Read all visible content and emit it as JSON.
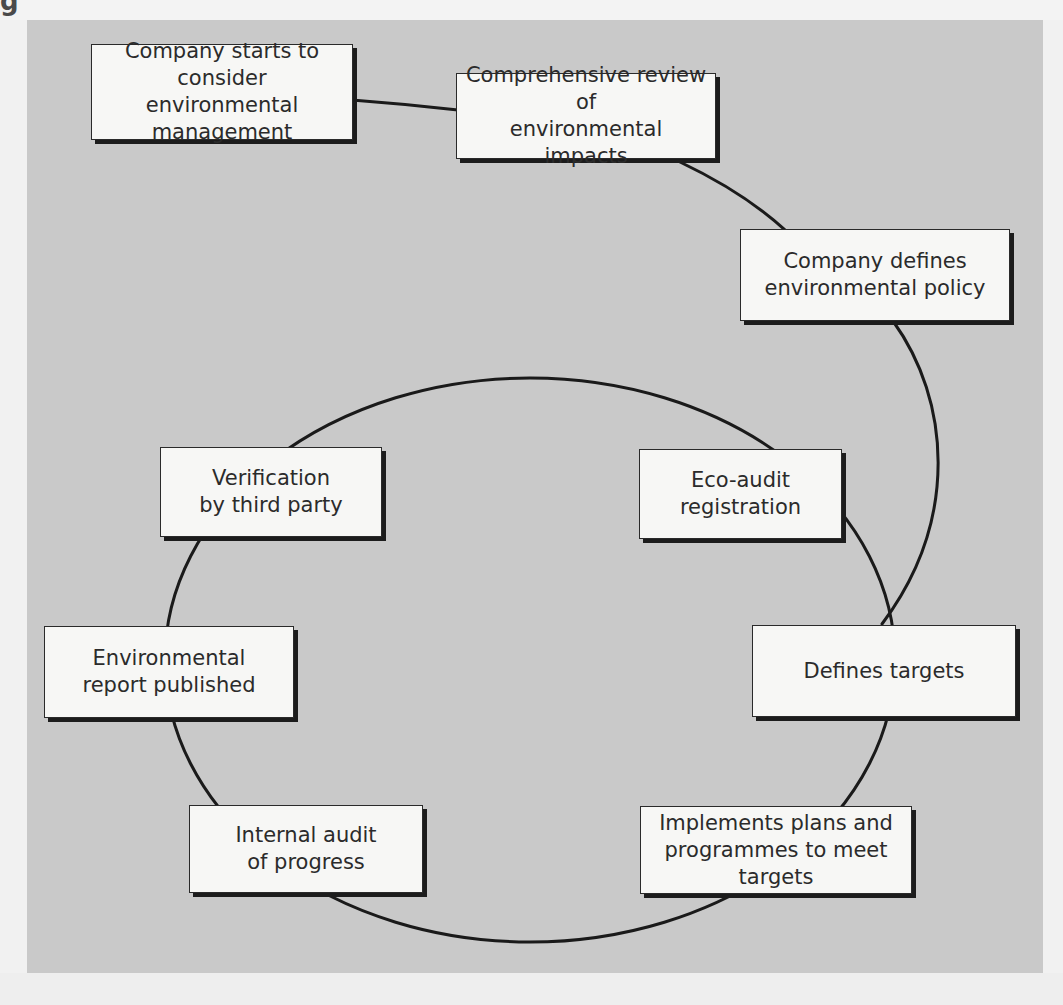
{
  "diagram": {
    "header_fragment": "g",
    "colors": {
      "panel_background": "#c9c9c9",
      "node_background": "#f7f7f5",
      "node_border": "#2a2a2a",
      "node_shadow": "#1c1c1c",
      "connector": "#1a1a1a",
      "text": "#2b2b2b"
    },
    "nodes": [
      {
        "id": "start",
        "label": "Company starts to\nconsider environmental\nmanagement"
      },
      {
        "id": "review",
        "label": "Comprehensive review of\nenvironmental impacts"
      },
      {
        "id": "policy",
        "label": "Company defines\nenvironmental policy"
      },
      {
        "id": "verification",
        "label": "Verification\nby third party"
      },
      {
        "id": "eco_audit",
        "label": "Eco-audit\nregistration"
      },
      {
        "id": "report",
        "label": "Environmental\nreport published"
      },
      {
        "id": "targets",
        "label": "Defines targets"
      },
      {
        "id": "internal_audit",
        "label": "Internal audit\nof progress"
      },
      {
        "id": "implements",
        "label": "Implements plans and\nprogrammes to meet targets"
      }
    ],
    "connections": [
      {
        "from": "start",
        "to": "review"
      },
      {
        "from": "review",
        "to": "policy"
      },
      {
        "from": "policy",
        "to": "targets"
      },
      {
        "from": "targets",
        "to": "implements"
      },
      {
        "from": "implements",
        "to": "internal_audit"
      },
      {
        "from": "internal_audit",
        "to": "report"
      },
      {
        "from": "report",
        "to": "verification"
      },
      {
        "from": "verification",
        "to": "eco_audit"
      },
      {
        "from": "eco_audit",
        "to": "targets"
      }
    ],
    "cycle": [
      "targets",
      "implements",
      "internal_audit",
      "report",
      "verification",
      "eco_audit"
    ]
  }
}
